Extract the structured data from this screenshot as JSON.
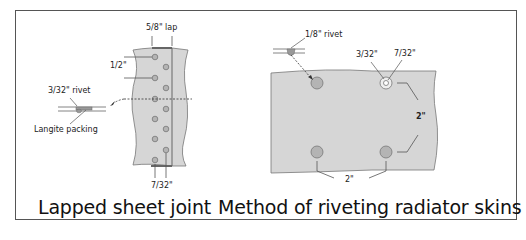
{
  "left_figure": {
    "caption": "Lapped sheet joint",
    "labels": {
      "lap": "5/8\" lap",
      "pitch": "1/2\"",
      "rivet": "3/32\" rivet",
      "packing": "Langite packing",
      "edge": "7/32\""
    }
  },
  "right_figure": {
    "caption": "Method of riveting radiator skins",
    "labels": {
      "rivet": "1/8\" rivet",
      "hole_inner": "3/32\"",
      "hole_outer": "7/32\"",
      "spacing_vertical": "2\"",
      "spacing_horizontal": "2\""
    }
  },
  "colors": {
    "sheet_fill": "#d4d4d4",
    "rivet_fill": "#b4b4b4",
    "line": "#555555",
    "frame": "#555555"
  }
}
